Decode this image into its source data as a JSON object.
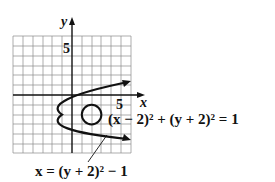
{
  "figure": {
    "axis_x_label": "x",
    "axis_y_label": "y",
    "x_tick_label": "5",
    "y_tick_label": "5",
    "circle_equation": "(x − 2)² + (y + 2)² = 1",
    "parabola_equation": "x = (y + 2)² − 1",
    "grid": {
      "x_min": -6,
      "x_max": 6,
      "y_min": -6,
      "y_max": 6
    },
    "circle": {
      "center": [
        2,
        -2
      ],
      "radius": 1
    },
    "parabola": {
      "vertex": [
        -1,
        -2
      ],
      "opens": "right"
    },
    "colors": {
      "ink": "#111111",
      "grid": "#8a8a8a",
      "background": "#ffffff"
    }
  }
}
